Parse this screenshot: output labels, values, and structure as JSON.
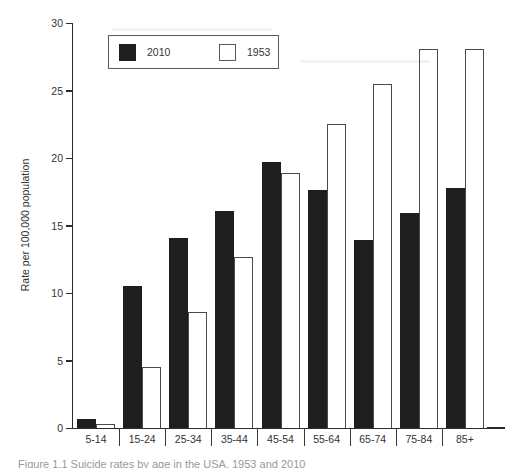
{
  "chart_data": {
    "type": "bar",
    "title": "",
    "xlabel": "",
    "ylabel": "Rate per 100,000 population",
    "ylim": [
      0,
      30
    ],
    "yticks": [
      0,
      5,
      10,
      15,
      20,
      25,
      30
    ],
    "grid": false,
    "legend_position": "inside-top-left",
    "categories": [
      "5-14",
      "15-24",
      "25-34",
      "35-44",
      "45-54",
      "55-64",
      "65-74",
      "75-84",
      "85+"
    ],
    "series": [
      {
        "name": "2010",
        "style": "filled",
        "fill": "#1e1e1e",
        "values": [
          0.7,
          10.5,
          14.1,
          16.1,
          19.7,
          17.6,
          13.9,
          15.9,
          17.8
        ]
      },
      {
        "name": "1953",
        "style": "outlined",
        "fill": "#ffffff",
        "outline": "#4a4a4a",
        "values": [
          0.3,
          4.5,
          8.6,
          12.7,
          18.9,
          22.5,
          25.5,
          28.1,
          28.1
        ]
      }
    ]
  },
  "caption": {
    "fragment": "Figure 1.1 Suicide rates by age in the USA, 1953 and 2010"
  }
}
